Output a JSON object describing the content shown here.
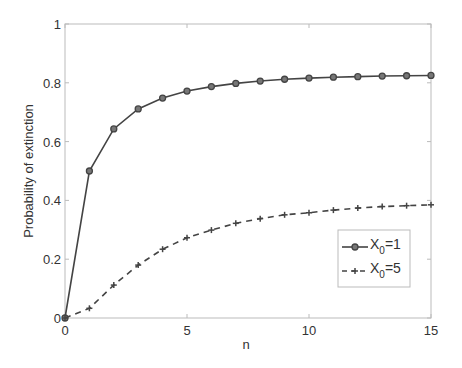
{
  "chart_data": {
    "type": "line",
    "title": "",
    "xlabel": "n",
    "ylabel": "Probability of extinction",
    "xlim": [
      0,
      15
    ],
    "ylim": [
      0,
      1
    ],
    "grid": false,
    "legend_position": "inside-right",
    "x_ticks": [
      0,
      5,
      10,
      15
    ],
    "y_ticks": [
      0,
      0.2,
      0.4,
      0.6,
      0.8,
      1
    ],
    "x_tick_labels": [
      "0",
      "5",
      "10",
      "15"
    ],
    "y_tick_labels": [
      "0",
      "0.2",
      "0.4",
      "0.6",
      "0.8",
      "1"
    ],
    "x": [
      0,
      1,
      2,
      3,
      4,
      5,
      6,
      7,
      8,
      9,
      10,
      11,
      12,
      13,
      14,
      15
    ],
    "series": [
      {
        "name": "X0=1",
        "legend_base": "X",
        "legend_sub": "0",
        "legend_rest": "=1",
        "style": "solid",
        "marker": "circle",
        "color": "#444444",
        "values": [
          0,
          0.5,
          0.643,
          0.711,
          0.748,
          0.772,
          0.787,
          0.798,
          0.806,
          0.812,
          0.816,
          0.819,
          0.821,
          0.823,
          0.824,
          0.825
        ]
      },
      {
        "name": "X0=5",
        "legend_base": "X",
        "legend_sub": "0",
        "legend_rest": "=5",
        "style": "dashed",
        "marker": "plus",
        "color": "#444444",
        "values": [
          0,
          0.033,
          0.112,
          0.18,
          0.234,
          0.273,
          0.299,
          0.322,
          0.338,
          0.351,
          0.358,
          0.367,
          0.374,
          0.379,
          0.382,
          0.385
        ]
      }
    ]
  }
}
